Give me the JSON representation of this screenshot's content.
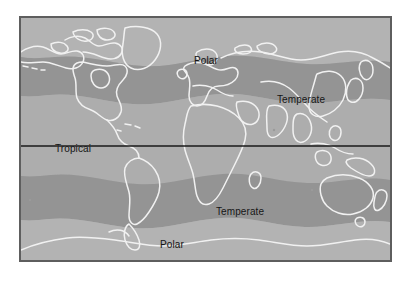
{
  "figure": {
    "kind": "world-climate-zone-map",
    "projection": "equirectangular",
    "page_background": "#ffffff"
  },
  "map": {
    "frame": {
      "border_color": "#5e5e5e",
      "border_width_px": 2,
      "x": 19,
      "y": 16,
      "width": 373,
      "height": 246
    },
    "base_fill": "#a9a9a9",
    "coastline_color": "#f1f1f1",
    "equator_line_color": "#1a1a1a",
    "zones": [
      {
        "name": "Polar",
        "hemisphere": "north",
        "fill": "#b2b2b2",
        "label": "Polar",
        "label_x": 173,
        "label_y": 37
      },
      {
        "name": "Temperate",
        "hemisphere": "north",
        "fill": "#949494",
        "label": "Temperate",
        "label_x": 256,
        "label_y": 76
      },
      {
        "name": "Tropical",
        "hemisphere": "equatorial",
        "fill": "#adadad",
        "label": "Tropical",
        "label_x": 34,
        "label_y": 125
      },
      {
        "name": "Temperate",
        "hemisphere": "south",
        "fill": "#949494",
        "label": "Temperate",
        "label_x": 195,
        "label_y": 188
      },
      {
        "name": "Polar",
        "hemisphere": "south",
        "fill": "#b2b2b2",
        "label": "Polar",
        "label_x": 139,
        "label_y": 221
      }
    ],
    "labels": {
      "polar_north": "Polar",
      "temperate_north": "Temperate",
      "tropical": "Tropical",
      "temperate_south": "Temperate",
      "polar_south": "Polar"
    }
  }
}
